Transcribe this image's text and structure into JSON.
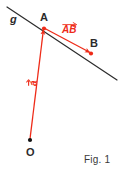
{
  "figure": {
    "caption": "Fig. 1",
    "colors": {
      "vector_red": "#ee2b18",
      "line_black": "#2b2b2b",
      "background": "#ffffff",
      "text_black": "#2b2b2b"
    },
    "labels": {
      "line_g": "g",
      "point_a": "A",
      "point_b": "B",
      "point_o": "O",
      "vector_a": "a",
      "vector_ab": "AB"
    },
    "geometry": {
      "line_g": {
        "x1": 7,
        "y1": 7,
        "x2": 117,
        "y2": 80
      },
      "point_o": {
        "x": 30,
        "y": 140
      },
      "point_a": {
        "x": 44,
        "y": 28
      },
      "point_b": {
        "x": 91,
        "y": 53
      },
      "vector_a": {
        "from": "O",
        "to": "A"
      },
      "vector_ab": {
        "from": "A",
        "to": "B"
      }
    }
  }
}
